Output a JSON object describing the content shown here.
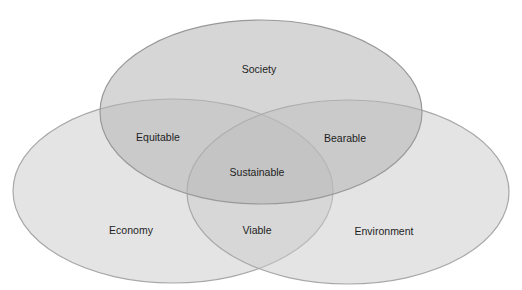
{
  "diagram": {
    "type": "venn",
    "sets": [
      {
        "id": "society",
        "label": "Society",
        "cx": 261,
        "cy": 112,
        "rx": 161,
        "ry": 92
      },
      {
        "id": "economy",
        "label": "Economy",
        "cx": 173,
        "cy": 191,
        "rx": 160,
        "ry": 92
      },
      {
        "id": "environment",
        "label": "Environment",
        "cx": 348,
        "cy": 192,
        "rx": 161,
        "ry": 92
      }
    ],
    "intersections": [
      {
        "sets": [
          "society",
          "economy"
        ],
        "label": "Equitable"
      },
      {
        "sets": [
          "society",
          "environment"
        ],
        "label": "Bearable"
      },
      {
        "sets": [
          "economy",
          "environment"
        ],
        "label": "Viable"
      },
      {
        "sets": [
          "society",
          "economy",
          "environment"
        ],
        "label": "Sustainable"
      }
    ],
    "colors": {
      "fill": "#c4c4c4",
      "fill_opacity": 0.55,
      "stroke": "#9a9a9a",
      "text": "#1e1e1e",
      "background": "#ffffff"
    }
  },
  "labels": {
    "society": "Society",
    "economy": "Economy",
    "environment": "Environment",
    "equitable": "Equitable",
    "bearable": "Bearable",
    "viable": "Viable",
    "sustainable": "Sustainable"
  }
}
